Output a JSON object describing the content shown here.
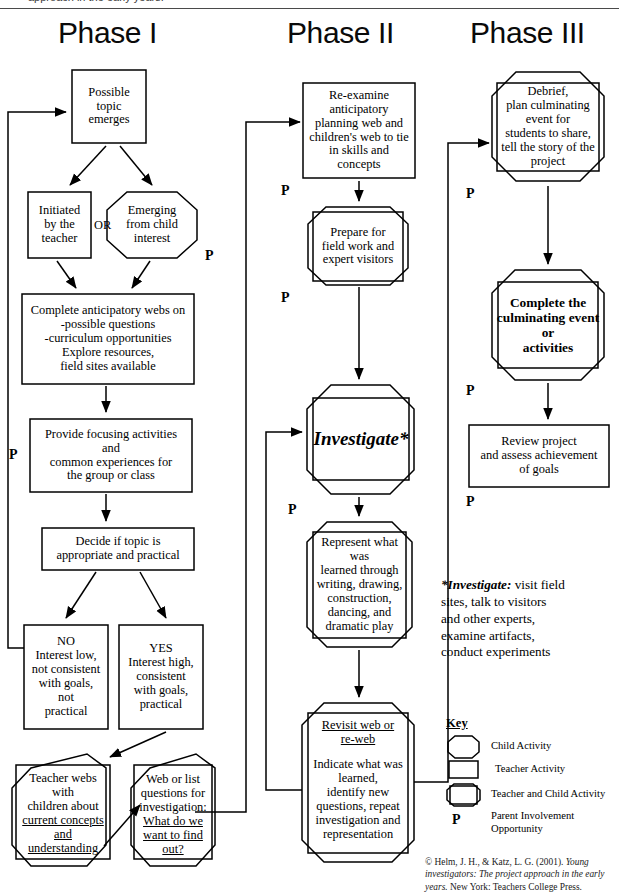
{
  "page_header": "approach in the early years.",
  "phases": [
    {
      "id": "phase-1",
      "label": "Phase I"
    },
    {
      "id": "phase-2",
      "label": "Phase II"
    },
    {
      "id": "phase-3",
      "label": "Phase III"
    }
  ],
  "or_label": "OR",
  "parent_marker": "P",
  "nodes": {
    "possible_topic": "Possible\ntopic\nemerges",
    "initiated_teacher": "Initiated\nby the\nteacher",
    "emerging_child": "Emerging\nfrom child\ninterest",
    "anticipatory_webs": "Complete anticipatory webs on\n-possible questions\n-curriculum opportunities\nExplore resources,\nfield sites available",
    "focusing_activities": "Provide focusing activities\nand\ncommon experiences for\nthe group or class",
    "decide_topic": "Decide if topic is\nappropriate and practical",
    "no_branch": "NO\nInterest low,\nnot consistent\nwith goals,\nnot\npractical",
    "yes_branch": "YES\nInterest high,\nconsistent\nwith goals,\npractical",
    "teacher_webs_1": "Teacher webs\nwith\nchildren about",
    "teacher_webs_2": "current concepts\nand\nunderstanding",
    "web_or_list_1": "Web or list\nquestions for\ninvestigation:",
    "web_or_list_2": "What do we\nwant to find\nout?",
    "re_examine": "Re-examine\nanticipatory\nplanning web and\nchildren's web to tie\nin skills and\nconcepts",
    "prepare_field": "Prepare for\nfield work and\nexpert visitors",
    "investigate": "Investigate*",
    "represent": "Represent what was\nlearned through\nwriting, drawing,\nconstruction,\ndancing, and\ndramatic play",
    "revisit_web_head": "Revisit web or\nre-web",
    "revisit_web_body": "Indicate what was\nlearned,\nidentify new\nquestions, repeat\ninvestigation and\nrepresentation",
    "debrief": "Debrief,\nplan culminating\nevent for\nstudents to share,\ntell the story of the\nproject",
    "complete_event": "Complete the\nculminating event\nor\nactivities",
    "review_project": "Review project\nand assess achievement\nof goals"
  },
  "footnote": {
    "term": "*Investigate:",
    "text": " visit field\nsites, talk to visitors\nand other experts,\nexamine artifacts,\nconduct experiments"
  },
  "key": {
    "title": "Key",
    "items": [
      {
        "shape": "rounded-octagon",
        "label": "Child Activity"
      },
      {
        "shape": "rectangle",
        "label": "Teacher Activity"
      },
      {
        "shape": "rectangle-in-octagon",
        "label": "Teacher and Child Activity"
      },
      {
        "shape": "letter-P",
        "label": "Parent Involvement\nOpportunity"
      }
    ]
  },
  "citation": {
    "prefix": "© Helm, J. H., & Katz, L. G. (2001). ",
    "italic": "Young investigators: The project approach in the early years.",
    "suffix": " New York: Teachers College Press."
  },
  "colors": {
    "stroke": "#000000",
    "background": "#ffffff",
    "text": "#000000"
  }
}
